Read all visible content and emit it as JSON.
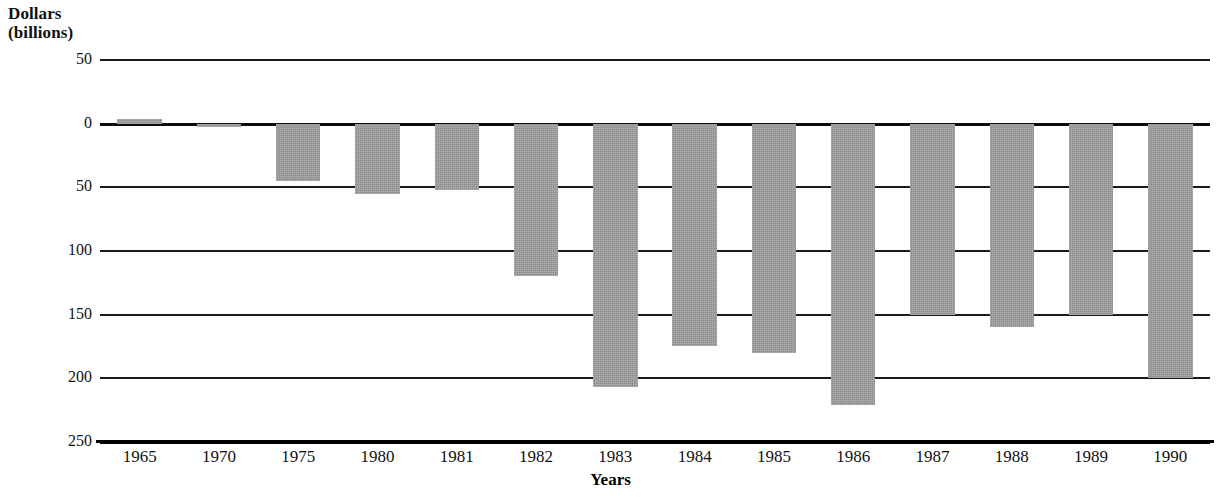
{
  "chart_data": {
    "type": "bar",
    "title": "",
    "ylabel": "Dollars (billions)",
    "ylabel_lines": [
      "Dollars",
      "(billions)"
    ],
    "xlabel": "Years",
    "categories": [
      "1965",
      "1970",
      "1975",
      "1980",
      "1981",
      "1982",
      "1983",
      "1984",
      "1985",
      "1986",
      "1987",
      "1988",
      "1989",
      "1990"
    ],
    "values": [
      4,
      -3,
      -45,
      -55,
      -52,
      -120,
      -207,
      -175,
      -180,
      -221,
      -150,
      -160,
      -150,
      -200
    ],
    "y_tick_labels": [
      "50",
      "0",
      "50",
      "100",
      "150",
      "200",
      "250"
    ],
    "y_tick_values": [
      50,
      0,
      -50,
      -100,
      -150,
      -200,
      -250
    ],
    "ylim": [
      -250,
      50
    ],
    "grid": true,
    "legend": "none",
    "bar_color": "#9b9b9b",
    "axis_color": "#111111",
    "note": "Values below the zero line are deficits shown as positive magnitudes on the axis"
  },
  "axis": {
    "y_title_line1": "Dollars",
    "y_title_line2": "(billions)",
    "x_title": "Years"
  }
}
